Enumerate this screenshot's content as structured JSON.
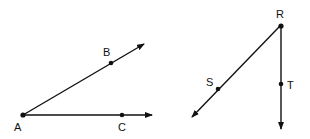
{
  "figures": [
    {
      "name": "angle-BAC",
      "vertex": {
        "label": "A",
        "x": 23,
        "y": 115
      },
      "rays": [
        {
          "point": {
            "label": "B",
            "x": 111,
            "y": 63
          },
          "tip": {
            "x": 144,
            "y": 44
          }
        },
        {
          "point": {
            "label": "C",
            "x": 122,
            "y": 115
          },
          "tip": {
            "x": 152,
            "y": 115
          }
        }
      ]
    },
    {
      "name": "angle-SRT",
      "vertex": {
        "label": "R",
        "x": 280,
        "y": 26
      },
      "rays": [
        {
          "point": {
            "label": "S",
            "x": 218,
            "y": 89
          },
          "tip": {
            "x": 192,
            "y": 117
          }
        },
        {
          "point": {
            "label": "T",
            "x": 281,
            "y": 84
          },
          "tip": {
            "x": 281,
            "y": 129
          }
        }
      ]
    }
  ],
  "labels": {
    "A": "A",
    "B": "B",
    "C": "C",
    "R": "R",
    "S": "S",
    "T": "T"
  }
}
